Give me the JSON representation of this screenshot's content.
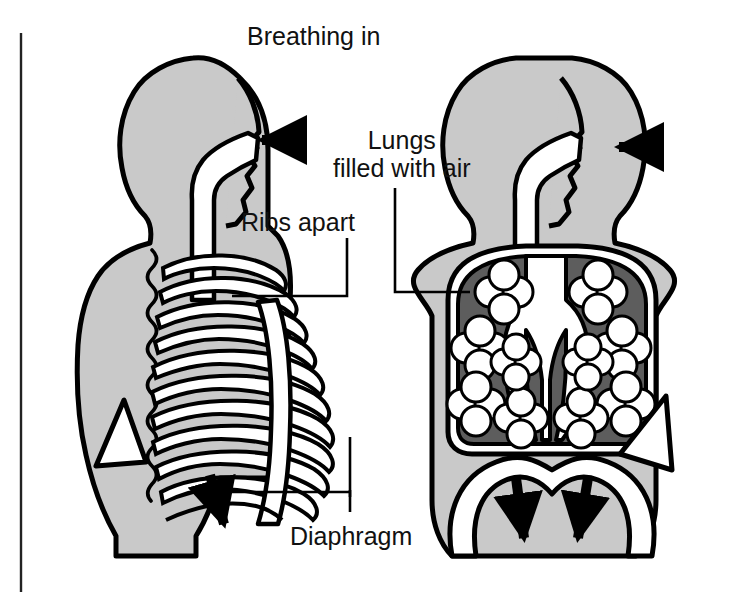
{
  "figure": {
    "title": "Breathing in",
    "labels": [
      {
        "id": "lungs",
        "text": "Lungs\nfilled with air"
      },
      {
        "id": "ribs",
        "text": "Ribs apart"
      },
      {
        "id": "diaphragm",
        "text": "Diaphragm"
      }
    ],
    "panels": [
      {
        "id": "left-panel",
        "name": "skeleton-ribcage-view",
        "description": "Torso profile showing rib cage spread apart and diaphragm moving down",
        "arrows": [
          "air-in-at-nose",
          "diaphragm-down"
        ]
      },
      {
        "id": "right-panel",
        "name": "lungs-front-view",
        "description": "Torso front view showing lungs filled with air and diaphragm flattening downward",
        "arrows": [
          "air-in-at-nose",
          "diaphragm-down-left",
          "diaphragm-down-right"
        ]
      }
    ],
    "colors": {
      "body": "#c9c9c9",
      "body_outline": "#000000",
      "lung_tissue": "#5d5d5d",
      "airway": "#ffffff",
      "bone": "#ffffff",
      "arrow": "#000000",
      "background": "#ffffff",
      "border_rule": "#222222",
      "text": "#111111"
    }
  }
}
